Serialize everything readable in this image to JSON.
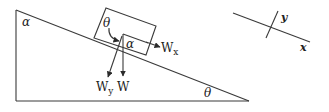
{
  "diagram": {
    "type": "inclined-plane-free-body",
    "labels": {
      "top_angle": "α",
      "box_angle_theta": "θ",
      "box_angle_alpha": "α",
      "incline_angle": "θ",
      "force_wx": "W",
      "force_wx_sub": "x",
      "force_wy": "W",
      "force_wy_sub": "y",
      "force_w": "W",
      "axis_x": "x",
      "axis_y": "y"
    },
    "colors": {
      "line": "#3a3a3a",
      "text": "#222222",
      "background": "#ffffff"
    }
  }
}
